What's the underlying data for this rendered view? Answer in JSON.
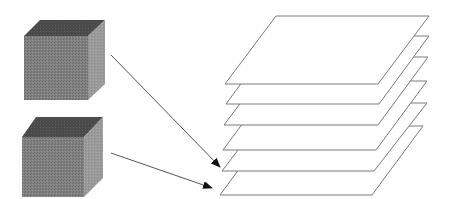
{
  "diagram": {
    "colors": {
      "background": "#ffffff",
      "cube_top": "#4a4a4a",
      "cube_front": "#808080",
      "cube_side": "#9a9a9a",
      "plane_fill": "#ffffff",
      "plane_stroke": "#7a7a7a",
      "arrow": "#555555"
    },
    "cubes": [
      {
        "name": "cube-1",
        "top": "40,20 105,20 88,36 24,36",
        "front": "24,36 88,36 88,100 24,100",
        "side": "88,36 105,20 105,84 88,100"
      },
      {
        "name": "cube-2",
        "top": "36,117 103,117 84,137 22,137",
        "front": "22,137 84,137 84,197 22,197",
        "side": "84,137 103,117 103,178 84,197"
      }
    ],
    "planes": [
      {
        "name": "plane-6",
        "points": "271,126 423,126 372,195 220,195"
      },
      {
        "name": "plane-5",
        "points": "274,103 427,103 374,171 222,171"
      },
      {
        "name": "plane-4",
        "points": "274,81 427,81 376,150 223,150"
      },
      {
        "name": "plane-3",
        "points": "275,57 428,57 378,125 224,125"
      },
      {
        "name": "plane-2",
        "points": "276,36 429,36 379,104 226,104"
      },
      {
        "name": "plane-1",
        "points": "276,16 429,16 378,84 225,84"
      }
    ],
    "arrows": [
      {
        "name": "arrow-cube1-to-plane5",
        "from": [
          111,
          55
        ],
        "to": [
          220,
          167
        ]
      },
      {
        "name": "arrow-cube2-to-plane6",
        "from": [
          111,
          153
        ],
        "to": [
          212,
          188
        ]
      }
    ]
  }
}
